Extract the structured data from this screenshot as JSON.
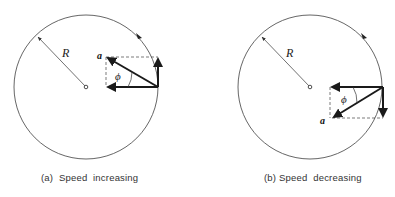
{
  "figure": {
    "panels": [
      {
        "id": "a",
        "caption": "(a)  Speed  increasing",
        "radius_label": "R",
        "angle_label": "ϕ",
        "vector_label": "a",
        "circle": {
          "cx": 86,
          "cy": 87,
          "r": 72
        },
        "radius_end": {
          "x": 36,
          "y": 35
        },
        "vector_origin": {
          "x": 158,
          "y": 87
        },
        "centripetal_tip": {
          "x": 106,
          "y": 87
        },
        "tangential_tip": {
          "x": 158,
          "y": 57
        },
        "total_tip": {
          "x": 106,
          "y": 57
        },
        "tangential_direction": "up",
        "motion_arrow": {
          "x": 139,
          "y": 37
        }
      },
      {
        "id": "b",
        "caption": "(b) Speed  decreasing",
        "radius_label": "R",
        "angle_label": "ϕ",
        "vector_label": "a",
        "circle": {
          "cx": 310,
          "cy": 87,
          "r": 72
        },
        "radius_end": {
          "x": 260,
          "y": 35
        },
        "vector_origin": {
          "x": 383,
          "y": 87
        },
        "centripetal_tip": {
          "x": 330,
          "y": 87
        },
        "tangential_tip": {
          "x": 383,
          "y": 118
        },
        "total_tip": {
          "x": 332,
          "y": 118
        },
        "tangential_direction": "down",
        "motion_arrow": {
          "x": 364,
          "y": 37
        }
      }
    ],
    "colors": {
      "ink": "#1a1a1a",
      "circle": "#555555",
      "dashed": "#444444",
      "background": "#ffffff"
    }
  }
}
